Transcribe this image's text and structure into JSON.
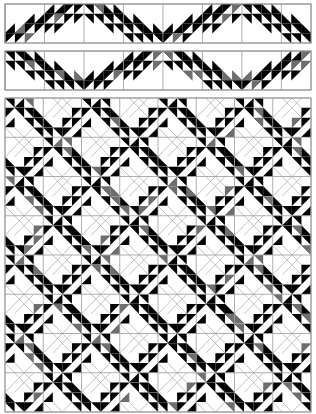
{
  "colors": {
    "dark": "#000000",
    "medium": "#6e6e6e",
    "light": "#ffffff",
    "grid": "#9a9a9a",
    "background": "#ffffff"
  },
  "borders": [
    {
      "name": "top-border-strip-1",
      "x": 5,
      "y": 4,
      "width": 306,
      "height": 39,
      "phase": 0
    },
    {
      "name": "top-border-strip-2",
      "x": 5,
      "y": 51,
      "width": 306,
      "height": 39,
      "phase": 1
    }
  ],
  "main_quilt": {
    "x": 5,
    "y": 98,
    "width": 306,
    "height": 314,
    "blocks_x": 8,
    "blocks_y": 8
  }
}
